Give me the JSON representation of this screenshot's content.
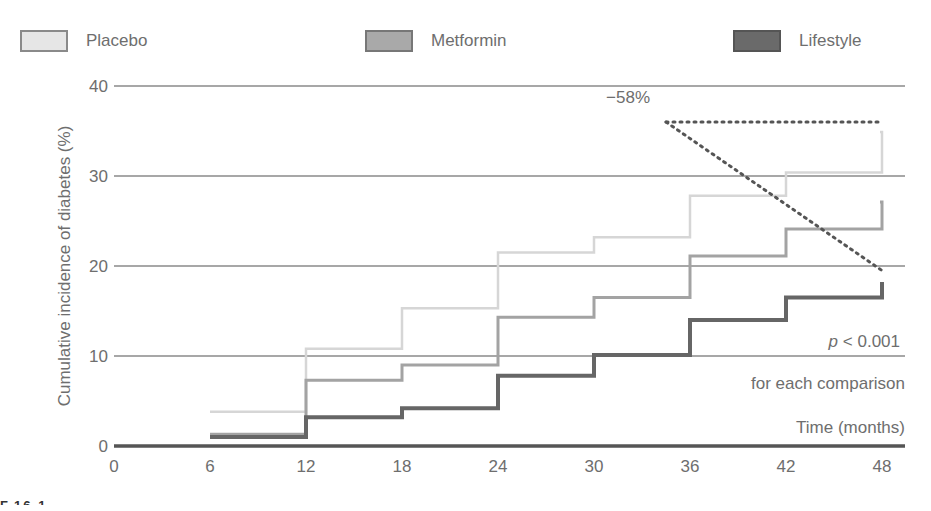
{
  "legend": [
    {
      "label": "Placebo",
      "color": "#e8e8e8",
      "border": "#8a8a8a"
    },
    {
      "label": "Metformin",
      "color": "#a9a9a9",
      "border": "#7a7a7a"
    },
    {
      "label": "Lifestyle",
      "color": "#6a6a6a",
      "border": "#555555"
    }
  ],
  "annotations": {
    "reduction": "−58%",
    "p_value_prefix": "p",
    "p_value": " < 0.001",
    "p_note": "for each comparison",
    "x_axis_title": "Time (months)"
  },
  "figure_label": "F.16.1",
  "chart_data": {
    "type": "line",
    "subtype": "step",
    "title": "",
    "xlabel": "Time (months)",
    "ylabel": "Cumulative incidence of diabetes (%)",
    "xlim": [
      0,
      48
    ],
    "ylim": [
      0,
      40
    ],
    "x_ticks": [
      0,
      6,
      12,
      18,
      24,
      30,
      36,
      42,
      48
    ],
    "y_ticks": [
      0,
      10,
      20,
      30,
      40
    ],
    "grid": "horizontal",
    "legend_position": "top",
    "x": [
      6,
      12,
      18,
      24,
      30,
      36,
      42,
      48
    ],
    "series": [
      {
        "name": "Placebo",
        "color": "#dcdcdc",
        "values": [
          3.8,
          10.8,
          15.3,
          21.5,
          23.2,
          27.8,
          30.4,
          34.9
        ]
      },
      {
        "name": "Metformin",
        "color": "#a5a5a5",
        "values": [
          1.3,
          7.3,
          9.0,
          14.3,
          16.5,
          21.1,
          24.1,
          27.1
        ]
      },
      {
        "name": "Lifestyle",
        "color": "#6a6a6a",
        "values": [
          1.0,
          3.2,
          4.2,
          7.8,
          10.1,
          14.0,
          16.5,
          18.0
        ]
      }
    ],
    "annotations": [
      {
        "text": "−58%",
        "type": "dotted-bracket",
        "from": {
          "x": 34.5,
          "y": 36
        },
        "to_top": {
          "x": 48,
          "y": 36
        },
        "to_bottom": {
          "x": 48,
          "y": 19.5
        }
      },
      {
        "text": "p < 0.001 for each comparison",
        "x": 48,
        "y": 10
      }
    ]
  }
}
